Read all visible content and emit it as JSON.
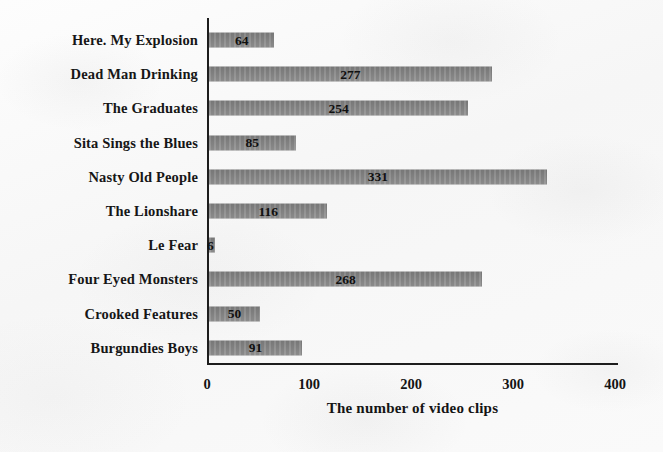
{
  "chart_data": {
    "type": "bar",
    "orientation": "horizontal",
    "title": "",
    "xlabel": "The number of video clips",
    "ylabel": "",
    "xlim": [
      0,
      400
    ],
    "xticks": [
      "0",
      "100",
      "200",
      "300",
      "400"
    ],
    "grid": false,
    "legend": null,
    "bar_color": "#828282",
    "categories": [
      "Here. My Explosion",
      "Dead Man Drinking",
      "The Graduates",
      "Sita Sings the Blues",
      "Nasty Old People",
      "The Lionshare",
      "Le Fear",
      "Four Eyed Monsters",
      "Crooked Features",
      "Burgundies Boys"
    ],
    "values": [
      64,
      277,
      254,
      85,
      331,
      116,
      6,
      268,
      50,
      91
    ],
    "value_labels": [
      "64",
      "277",
      "254",
      "85",
      "331",
      "116",
      "6",
      "268",
      "50",
      "91"
    ]
  }
}
